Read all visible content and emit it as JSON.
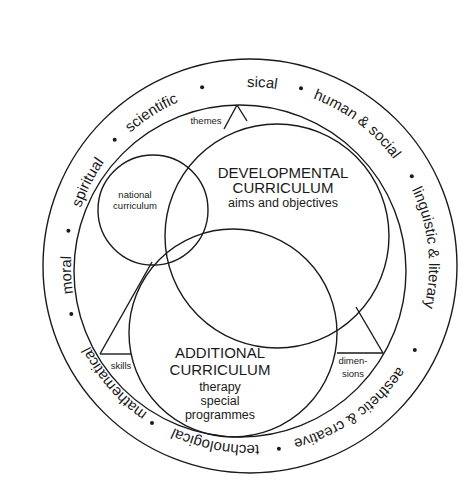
{
  "diagram": {
    "outer_ring": {
      "labels": [
        {
          "text": "physical",
          "angle_deg": 0
        },
        {
          "text": "human & social",
          "angle_deg": 37
        },
        {
          "text": "linguistic & literary",
          "angle_deg": 84
        },
        {
          "text": "aesthetic & creative",
          "angle_deg": 145
        },
        {
          "text": "technological",
          "angle_deg": 191
        },
        {
          "text": "mathematical",
          "angle_deg": 229
        },
        {
          "text": "moral",
          "angle_deg": 267
        },
        {
          "text": "spiritual",
          "angle_deg": 297
        },
        {
          "text": "scientific",
          "angle_deg": 327
        }
      ],
      "separator_dot_angles_deg": [
        16,
        61,
        117,
        171,
        212,
        255,
        281,
        313,
        345
      ]
    },
    "developmental": {
      "title_line1": "DEVELOPMENTAL",
      "title_line2": "CURRICULUM",
      "subtitle": "aims and objectives"
    },
    "additional": {
      "title_line1": "ADDITIONAL",
      "title_line2": "CURRICULUM",
      "sub_line1": "therapy",
      "sub_line2": "special",
      "sub_line3": "programmes"
    },
    "national": {
      "line1": "national",
      "line2": "curriculum"
    },
    "triangle_labels": {
      "top": "themes",
      "left": "skills",
      "right_line1": "dimen-",
      "right_line2": "sions"
    },
    "colors": {
      "ink": "#1a1a1a",
      "background": "#ffffff"
    }
  }
}
